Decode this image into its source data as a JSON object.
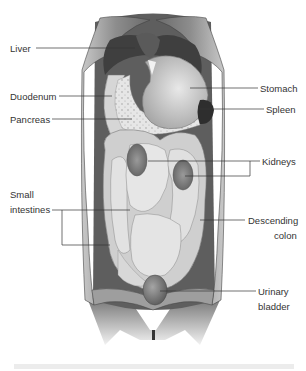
{
  "figure": {
    "colors": {
      "background": "#ffffff",
      "body_wall": "#9a9a9a",
      "body_wall_light": "#c8c8c8",
      "cavity_dark": "#5e5e5e",
      "organ_light": "#dcdcdc",
      "organ_mid": "#b5b5b5",
      "organ_dark": "#3a3a3a",
      "leader_line": "#333333",
      "label_text": "#333333"
    },
    "labels": {
      "liver": "Liver",
      "duodenum": "Duodenum",
      "pancreas": "Pancreas",
      "small_intestines_line1": "Small",
      "small_intestines_line2": "intestines",
      "stomach": "Stomach",
      "spleen": "Spleen",
      "kidneys": "Kidneys",
      "descending_colon_line1": "Descending",
      "descending_colon_line2": "colon",
      "urinary_bladder_line1": "Urinary",
      "urinary_bladder_line2": "bladder"
    }
  }
}
